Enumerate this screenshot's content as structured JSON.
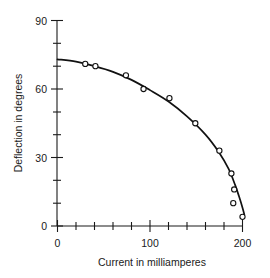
{
  "chart_data": {
    "type": "line",
    "title": "",
    "subtitle": "",
    "xlabel": "Current in milliamperes",
    "ylabel": "Deflection in degrees",
    "xlim": [
      0,
      215
    ],
    "ylim": [
      0,
      90
    ],
    "xticks": [
      0,
      100,
      200
    ],
    "xtick_labels": [
      "0",
      "100",
      "200"
    ],
    "x_minor_ticks": [
      20,
      40,
      60,
      80,
      120,
      140,
      160,
      180
    ],
    "yticks": [
      0,
      30,
      60,
      90
    ],
    "ytick_labels": [
      "0",
      "30",
      "60",
      "90"
    ],
    "y_minor_ticks": [
      10,
      20,
      40,
      50,
      70,
      80
    ],
    "grid": false,
    "legend": false,
    "legend_position": "none",
    "marker": "open-circle",
    "line_color": "#111111",
    "marker_face_color": "#ffffff",
    "marker_edge_color": "#111111",
    "background_color": "#ffffff",
    "series": [
      {
        "name": "Deflection vs current",
        "x": [
          30,
          41,
          74,
          93,
          121,
          149,
          175,
          188,
          191,
          190,
          200
        ],
        "y": [
          71,
          70,
          66,
          60,
          56,
          45,
          33,
          23,
          16,
          10,
          4
        ]
      }
    ],
    "fitted_curve": {
      "name": "smooth fitted curve",
      "x": [
        0,
        20,
        40,
        60,
        80,
        100,
        120,
        140,
        160,
        175,
        185,
        192,
        197,
        200,
        202
      ],
      "y": [
        73,
        72,
        70,
        67.5,
        64,
        59.5,
        54.5,
        48,
        40,
        32,
        25,
        18,
        12,
        8,
        5
      ]
    }
  },
  "axes": {
    "y_axis_name": "deflection-axis",
    "x_axis_name": "current-axis"
  }
}
